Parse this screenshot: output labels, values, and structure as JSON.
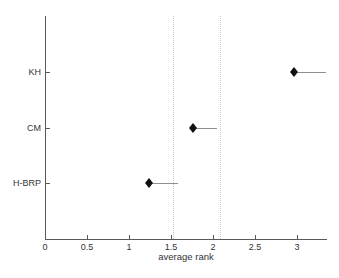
{
  "chart_data": {
    "type": "scatter",
    "title": "",
    "xlabel": "average rank",
    "ylabel": "",
    "categories": [
      "KH",
      "CM",
      "H-BRP"
    ],
    "series": [
      {
        "name": "KH",
        "marker": 2.97,
        "line_end": 3.35
      },
      {
        "name": "CM",
        "marker": 1.76,
        "line_end": 2.05
      },
      {
        "name": "H-BRP",
        "marker": 1.24,
        "line_end": 1.58
      }
    ],
    "row_positions": [
      3,
      2,
      1
    ],
    "ylim": [
      0,
      4
    ],
    "xlim": [
      0,
      3.36
    ],
    "x_ticks": [
      0,
      0.5,
      1,
      1.5,
      2,
      2.5,
      3
    ],
    "x_tick_labels": [
      "0",
      "0.5",
      "1",
      "1.5",
      "2",
      "2.5",
      "3"
    ],
    "dotted_vlines": [
      1.53,
      2.08
    ],
    "grid": false,
    "legend_position": "none",
    "marker_shape": "filled-diamond",
    "colors": {
      "background": "#ffffff",
      "axis": "#5a5a5a",
      "text": "#333333",
      "marker": "#101010",
      "interval_line": "#8f8f8f",
      "dotted_line": "#c9c9c9"
    }
  }
}
